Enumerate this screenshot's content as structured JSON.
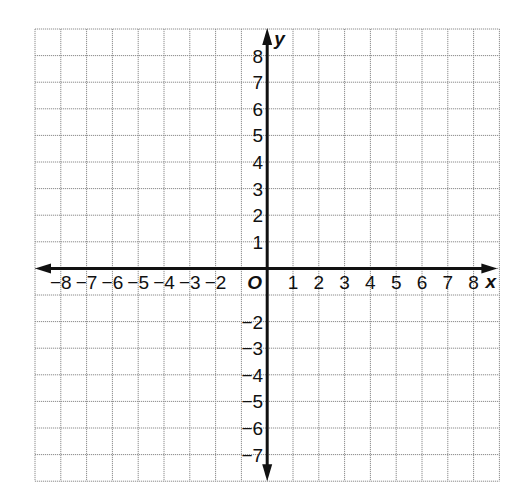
{
  "chart_data": {
    "type": "coordinate_plane",
    "title": "",
    "xlabel": "x",
    "ylabel": "y",
    "origin_label": "O",
    "grid": true,
    "x_range": [
      -9,
      9
    ],
    "y_range": [
      -8,
      9
    ],
    "x_tick_labels": [
      "−8",
      "−7",
      "−6",
      "−5",
      "−4",
      "−3",
      "−2",
      "1",
      "2",
      "3",
      "4",
      "5",
      "6",
      "7",
      "8"
    ],
    "x_tick_values": [
      -8,
      -7,
      -6,
      -5,
      -4,
      -3,
      -2,
      1,
      2,
      3,
      4,
      5,
      6,
      7,
      8
    ],
    "y_tick_labels": [
      "8",
      "7",
      "6",
      "5",
      "4",
      "3",
      "2",
      "1",
      "−2",
      "−3",
      "−4",
      "−5",
      "−6",
      "−7"
    ],
    "y_tick_values": [
      8,
      7,
      6,
      5,
      4,
      3,
      2,
      1,
      -2,
      -3,
      -4,
      -5,
      -6,
      -7
    ],
    "series": []
  },
  "layout": {
    "grid_left": 35,
    "grid_top": 29,
    "cell_w": 25.8,
    "cell_h": 26.6,
    "cols": 18,
    "rows": 17,
    "origin_col": 9,
    "origin_row": 9
  },
  "colors": {
    "grid": "#8c8c8c",
    "axis": "#111111",
    "background": "#ffffff"
  }
}
